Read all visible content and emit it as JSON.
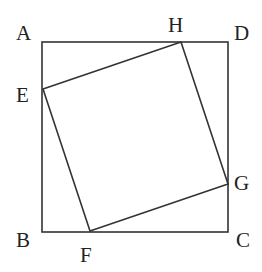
{
  "diagram": {
    "outer_square": [
      "A",
      "B",
      "C",
      "D"
    ],
    "inner_square": [
      "E",
      "F",
      "G",
      "H"
    ],
    "points": {
      "A": {
        "label": "A",
        "x": 42,
        "y": 42,
        "lx": 16,
        "ly": 40
      },
      "B": {
        "label": "B",
        "x": 42,
        "y": 232,
        "lx": 16,
        "ly": 247
      },
      "C": {
        "label": "C",
        "x": 228,
        "y": 232,
        "lx": 236,
        "ly": 247
      },
      "D": {
        "label": "D",
        "x": 228,
        "y": 42,
        "lx": 234,
        "ly": 40
      },
      "E": {
        "label": "E",
        "x": 43,
        "y": 89,
        "lx": 16,
        "ly": 102
      },
      "F": {
        "label": "F",
        "x": 90,
        "y": 231,
        "lx": 80,
        "ly": 262
      },
      "G": {
        "label": "G",
        "x": 228,
        "y": 184,
        "lx": 234,
        "ly": 190
      },
      "H": {
        "label": "H",
        "x": 181,
        "y": 42,
        "lx": 168,
        "ly": 32
      }
    }
  }
}
